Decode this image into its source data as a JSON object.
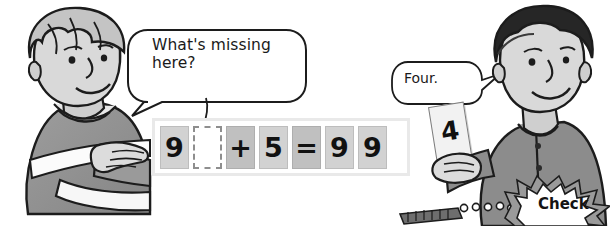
{
  "scene": {
    "width": 610,
    "height": 226,
    "background": "#ffffff",
    "description": "Illustrated math worksheet panel: two cartoon boys discussing a fill-in-the-blank addition equation"
  },
  "bubbles": {
    "left": {
      "text": "What's missing\nhere?",
      "speaker": "light-haired boy on the left",
      "tail_direction": "down-left"
    },
    "right": {
      "text": "Four.",
      "speaker": "dark-haired boy on the right",
      "tail_direction": "right"
    }
  },
  "equation": {
    "tiles": [
      {
        "value": "9",
        "kind": "num"
      },
      {
        "value": "",
        "kind": "blank"
      },
      {
        "value": "+",
        "kind": "op"
      },
      {
        "value": "5",
        "kind": "num"
      },
      {
        "value": "=",
        "kind": "op"
      },
      {
        "value": "9",
        "kind": "num"
      },
      {
        "value": "9",
        "kind": "num"
      }
    ],
    "expression": "9 _ + 5 = 9 9",
    "missing_answer": "4"
  },
  "answer_card": {
    "value": "4"
  },
  "check_burst": {
    "label": "Check"
  },
  "characters": {
    "left_boy": {
      "hair": "light gray",
      "clothing": "dark sweater with white horizontal stripe",
      "gesture": "pointing right toward the equation"
    },
    "right_boy": {
      "hair": "dark black",
      "clothing": "gray buttoned shirt",
      "gesture": "holding up a number card"
    }
  },
  "colors": {
    "tile_number": "#d2d2d2",
    "tile_operator": "#c0c0c0",
    "frame_border": "#e9e9e9",
    "ink": "#1a1a1a",
    "skin": "#d8d8d8",
    "sweater_dark": "#8f8f8f",
    "hair_dark": "#2a2a2a"
  }
}
